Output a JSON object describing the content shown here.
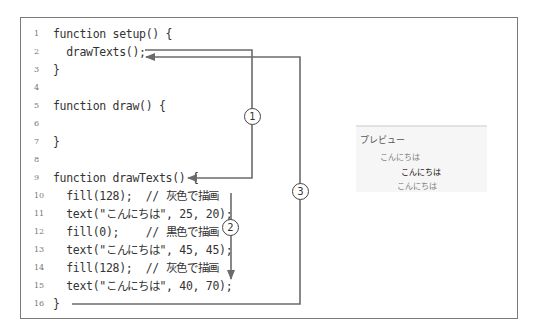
{
  "code": {
    "lines": [
      {
        "num": "1",
        "text": "function setup() {"
      },
      {
        "num": "2",
        "text": "  drawTexts();"
      },
      {
        "num": "3",
        "text": "}"
      },
      {
        "num": "4",
        "text": ""
      },
      {
        "num": "5",
        "text": "function draw() {"
      },
      {
        "num": "6",
        "text": ""
      },
      {
        "num": "7",
        "text": "}"
      },
      {
        "num": "8",
        "text": ""
      },
      {
        "num": "9",
        "text": "function drawTexts() {"
      },
      {
        "num": "10",
        "text": "  fill(128);  // 灰色で描画"
      },
      {
        "num": "11",
        "text": "  text(\"こんにちは\", 25, 20);"
      },
      {
        "num": "12",
        "text": "  fill(0);    // 黒色で描画"
      },
      {
        "num": "13",
        "text": "  text(\"こんにちは\", 45, 45);"
      },
      {
        "num": "14",
        "text": "  fill(128);  // 灰色で描画"
      },
      {
        "num": "15",
        "text": "  text(\"こんにちは\", 40, 70);"
      },
      {
        "num": "16",
        "text": "}"
      }
    ]
  },
  "annotations": {
    "step1": "1",
    "step2": "2",
    "step3": "3"
  },
  "preview": {
    "title": "プレビュー",
    "texts": [
      {
        "text": "こんにちは",
        "color": "#808080"
      },
      {
        "text": "こんにちは",
        "color": "#000000"
      },
      {
        "text": "こんにちは",
        "color": "#808080"
      }
    ]
  },
  "colors": {
    "arrow": "#6b6b6b",
    "frame": "#7a7a7a",
    "code_text": "#333333",
    "preview_bg": "#f6f6f6"
  }
}
